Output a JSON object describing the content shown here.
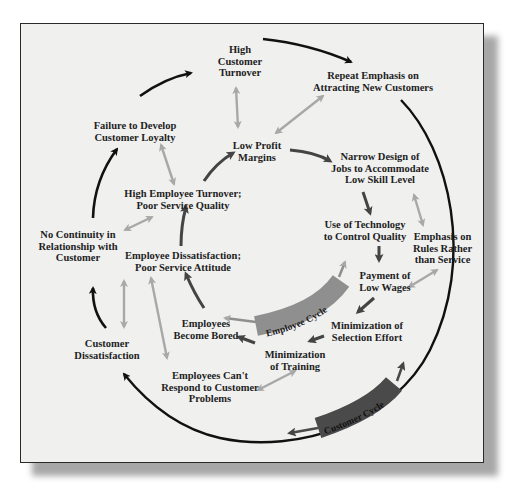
{
  "figure": {
    "title": "",
    "cycles": [
      {
        "id": "employee-cycle",
        "label": "Employee Cycle",
        "color": "#8f8f8f"
      },
      {
        "id": "customer-cycle",
        "label": "Customer Cycle",
        "color": "#4a4a4a"
      }
    ],
    "nodes": {
      "high_customer_turnover": "High\nCustomer\nTurnover",
      "repeat_emphasis": "Repeat Emphasis on\nAttracting New Customers",
      "failure_loyalty": "Failure to Develop\nCustomer Loyalty",
      "low_profit_margins": "Low Profit\nMargins",
      "narrow_design": "Narrow Design of\nJobs to Accommodate\nLow Skill Level",
      "high_employee_turnover": "High Employee Turnover;\nPoor Service Quality",
      "use_of_technology": "Use of Technology\nto Control Quality",
      "emphasis_rules": "Emphasis on\nRules Rather\nthan Service",
      "no_continuity": "No Continuity in\nRelationship with\nCustomer",
      "employee_dissatisfaction": "Employee Dissatisfaction;\nPoor Service Attitude",
      "payment_low_wages": "Payment of\nLow Wages",
      "employees_bored": "Employees\nBecome Bored",
      "minimization_selection": "Minimization of\nSelection Effort",
      "customer_dissatisfaction": "Customer\nDissatisfaction",
      "minimization_training": "Minimization\nof Training",
      "employees_cant_respond": "Employees Can't\nRespond to Customer\nProblems"
    },
    "edges": {
      "customer_cycle": [
        [
          "Customer Dissatisfaction",
          "No Continuity in Relationship with Customer"
        ],
        [
          "No Continuity in Relationship with Customer",
          "Failure to Develop Customer Loyalty"
        ],
        [
          "Failure to Develop Customer Loyalty",
          "High Customer Turnover"
        ],
        [
          "High Customer Turnover",
          "Repeat Emphasis on Attracting New Customers"
        ],
        [
          "Repeat Emphasis on Attracting New Customers",
          "Customer Dissatisfaction"
        ]
      ],
      "employee_cycle": [
        [
          "Low Profit Margins",
          "Narrow Design of Jobs to Accommodate Low Skill Level"
        ],
        [
          "Narrow Design of Jobs to Accommodate Low Skill Level",
          "Use of Technology to Control Quality"
        ],
        [
          "Use of Technology to Control Quality",
          "Payment of Low Wages"
        ],
        [
          "Payment of Low Wages",
          "Minimization of Selection Effort"
        ],
        [
          "Minimization of Selection Effort",
          "Minimization of Training"
        ],
        [
          "Minimization of Training",
          "Employees Become Bored"
        ],
        [
          "Employees Become Bored",
          "Employee Dissatisfaction; Poor Service Attitude"
        ],
        [
          "Employee Dissatisfaction; Poor Service Attitude",
          "High Employee Turnover; Poor Service Quality"
        ],
        [
          "High Employee Turnover; Poor Service Quality",
          "Low Profit Margins"
        ]
      ],
      "bidirectional_links": [
        [
          "High Customer Turnover",
          "Low Profit Margins"
        ],
        [
          "Repeat Emphasis on Attracting New Customers",
          "Low Profit Margins"
        ],
        [
          "Failure to Develop Customer Loyalty",
          "High Employee Turnover; Poor Service Quality"
        ],
        [
          "No Continuity in Relationship with Customer",
          "High Employee Turnover; Poor Service Quality"
        ],
        [
          "Customer Dissatisfaction",
          "Employee Dissatisfaction; Poor Service Attitude"
        ],
        [
          "Employee Dissatisfaction; Poor Service Attitude",
          "Employees Can't Respond to Customer Problems"
        ],
        [
          "Narrow Design of Jobs to Accommodate Low Skill Level",
          "Emphasis on Rules Rather than Service"
        ],
        [
          "Emphasis on Rules Rather than Service",
          "Payment of Low Wages"
        ],
        [
          "Minimization of Training",
          "Employees Can't Respond to Customer Problems"
        ]
      ]
    },
    "colors": {
      "frame_bg": "#f0f0ef",
      "customer_arrow": "#111111",
      "employee_arrow": "#444444",
      "link_arrow": "#a8a8a8"
    }
  }
}
